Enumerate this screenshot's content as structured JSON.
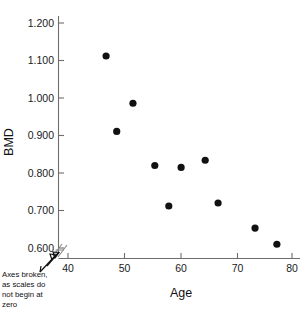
{
  "chart_data": {
    "type": "scatter",
    "title": "",
    "xlabel": "Age",
    "ylabel": "BMD",
    "xlim": [
      38,
      82
    ],
    "ylim": [
      0.57,
      1.24
    ],
    "grid": false,
    "legend": null,
    "x_ticks": [
      "40",
      "50",
      "60",
      "70",
      "80"
    ],
    "x_tick_values": [
      40,
      50,
      60,
      70,
      80
    ],
    "y_ticks": [
      "0.600",
      "0.700",
      "0.800",
      "0.900",
      "1.000",
      "1.100",
      "1.200"
    ],
    "y_tick_values": [
      0.6,
      0.7,
      0.8,
      0.9,
      1.0,
      1.1,
      1.2
    ],
    "x": [
      46.8,
      48.7,
      51.6,
      55.5,
      58.0,
      60.2,
      64.5,
      66.8,
      73.4,
      77.3
    ],
    "y": [
      1.112,
      0.911,
      0.986,
      0.82,
      0.712,
      0.815,
      0.834,
      0.72,
      0.653,
      0.61
    ],
    "points": [
      {
        "age": 46.8,
        "bmd": 1.112
      },
      {
        "age": 48.7,
        "bmd": 0.911
      },
      {
        "age": 51.6,
        "bmd": 0.986
      },
      {
        "age": 55.5,
        "bmd": 0.82
      },
      {
        "age": 58.0,
        "bmd": 0.712
      },
      {
        "age": 60.2,
        "bmd": 0.815
      },
      {
        "age": 64.5,
        "bmd": 0.834
      },
      {
        "age": 66.8,
        "bmd": 0.72
      },
      {
        "age": 73.4,
        "bmd": 0.653
      },
      {
        "age": 77.3,
        "bmd": 0.61
      }
    ],
    "annotations": [
      {
        "name": "axes-broken-note",
        "lines": [
          "Axes broken,",
          "as scales do",
          "not begin at",
          "zero"
        ],
        "points_to": "axis-break-mark"
      }
    ],
    "marker": {
      "shape": "circle",
      "color": "#111111",
      "size": 3.6
    },
    "axis_color": "#6d6d6d"
  }
}
